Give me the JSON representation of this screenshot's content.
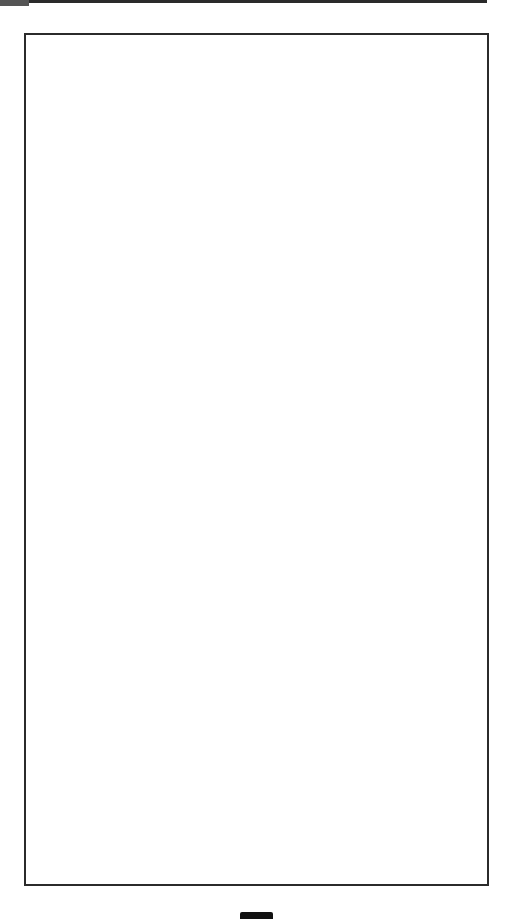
{
  "page": {
    "header": {
      "title": "",
      "rule_color": "#2a2a2a",
      "tab_color": "#555555"
    },
    "frame": {
      "border_color": "#2b2b2b",
      "content": ""
    },
    "footer": {
      "page_marker_color": "#111111"
    }
  }
}
